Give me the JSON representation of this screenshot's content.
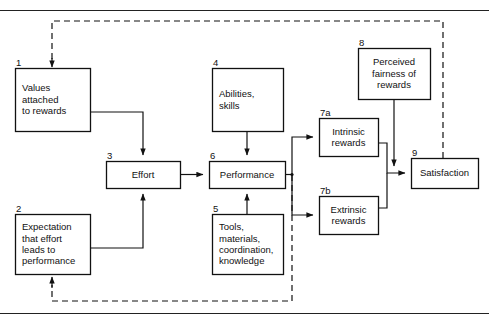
{
  "diagram": {
    "boxes": [
      {
        "id": "1",
        "number": "1",
        "lines": [
          "Values",
          "attached",
          "to rewards"
        ],
        "align": "left",
        "x": 15,
        "y": 68,
        "w": 75,
        "h": 63
      },
      {
        "id": "2",
        "number": "2",
        "lines": [
          "Expectation",
          "that effort",
          "leads to",
          "performance"
        ],
        "align": "left",
        "x": 15,
        "y": 214,
        "w": 75,
        "h": 60
      },
      {
        "id": "3",
        "number": "3",
        "lines": [
          "Effort"
        ],
        "align": "center",
        "x": 106,
        "y": 161,
        "w": 74,
        "h": 27
      },
      {
        "id": "4",
        "number": "4",
        "lines": [
          "Abilities,",
          "skills"
        ],
        "align": "left",
        "x": 212,
        "y": 68,
        "w": 71,
        "h": 63
      },
      {
        "id": "5",
        "number": "5",
        "lines": [
          "Tools,",
          "materials,",
          "coordination,",
          "knowledge"
        ],
        "align": "left",
        "x": 212,
        "y": 214,
        "w": 71,
        "h": 60
      },
      {
        "id": "6",
        "number": "6",
        "lines": [
          "Performance"
        ],
        "align": "center",
        "x": 209,
        "y": 161,
        "w": 76,
        "h": 27
      },
      {
        "id": "7a",
        "number": "7a",
        "lines": [
          "Intrinsic",
          "rewards"
        ],
        "align": "center",
        "x": 319,
        "y": 118,
        "w": 59,
        "h": 38
      },
      {
        "id": "7b",
        "number": "7b",
        "lines": [
          "Extrinsic",
          "rewards"
        ],
        "align": "center",
        "x": 319,
        "y": 196,
        "w": 59,
        "h": 38
      },
      {
        "id": "8",
        "number": "8",
        "lines": [
          "Perceived",
          "fairness of",
          "rewards"
        ],
        "align": "center",
        "x": 358,
        "y": 48,
        "w": 72,
        "h": 51
      },
      {
        "id": "9",
        "number": "9",
        "lines": [
          "Satisfaction"
        ],
        "align": "center",
        "x": 411,
        "y": 158,
        "w": 67,
        "h": 30
      }
    ],
    "colors": {
      "stroke": "#111111",
      "box_fill": "#ffffff",
      "background": "#ffffff",
      "rule": "#222222"
    },
    "edges": [
      {
        "name": "satisfaction-to-values-feedback",
        "style": "dashed",
        "from": "9",
        "to": "1"
      },
      {
        "name": "satisfaction-to-expectation-feedback",
        "style": "dashed",
        "from": "6",
        "to": "2"
      },
      {
        "name": "values-to-effort",
        "style": "solid",
        "from": "1",
        "to": "3"
      },
      {
        "name": "expectation-to-effort",
        "style": "solid",
        "from": "2",
        "to": "3"
      },
      {
        "name": "effort-to-performance",
        "style": "solid",
        "from": "3",
        "to": "6"
      },
      {
        "name": "abilities-to-performance",
        "style": "solid",
        "from": "4",
        "to": "6"
      },
      {
        "name": "tools-to-performance",
        "style": "solid",
        "from": "5",
        "to": "6"
      },
      {
        "name": "performance-to-intrinsic",
        "style": "solid",
        "from": "6",
        "to": "7a"
      },
      {
        "name": "performance-to-extrinsic",
        "style": "solid",
        "from": "6",
        "to": "7b"
      },
      {
        "name": "intrinsic-to-satisfaction",
        "style": "solid",
        "from": "7a",
        "to": "9"
      },
      {
        "name": "extrinsic-to-satisfaction",
        "style": "solid",
        "from": "7b",
        "to": "9"
      },
      {
        "name": "fairness-to-satisfaction",
        "style": "solid",
        "from": "8",
        "to": "9"
      }
    ]
  }
}
